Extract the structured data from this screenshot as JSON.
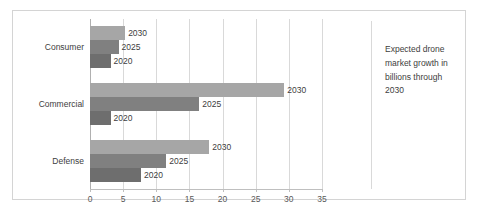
{
  "chart_data": {
    "type": "bar",
    "orientation": "horizontal",
    "title": "",
    "xlabel": "",
    "ylabel": "",
    "xlim": [
      0,
      35
    ],
    "xticks": [
      0,
      5,
      10,
      15,
      20,
      25,
      30,
      35
    ],
    "grid": true,
    "legend_position": "none",
    "categories": [
      "Consumer",
      "Commercial",
      "Defense"
    ],
    "series": [
      {
        "name": "2020",
        "values": [
          3.1,
          3.1,
          7.7
        ],
        "color": "#6e6e6e"
      },
      {
        "name": "2025",
        "values": [
          4.3,
          16.5,
          11.5
        ],
        "color": "#808080"
      },
      {
        "name": "2030",
        "values": [
          5.3,
          29.3,
          18.0
        ],
        "color": "#a6a6a6"
      }
    ],
    "data_labels": {
      "Consumer": {
        "2020": "2020",
        "2025": "2025",
        "2030": "2030"
      },
      "Commercial": {
        "2020": "2020",
        "2025": "2025",
        "2030": "2030"
      },
      "Defense": {
        "2020": "2020",
        "2025": "2025",
        "2030": "2030"
      }
    },
    "annotation": "Expected drone market growth in billions through 2030"
  },
  "colors": {
    "border": "#d4d4d4",
    "gridline": "#d9d9d9",
    "axis": "#bfbfbf",
    "text": "#404040",
    "tick_text": "#595959"
  }
}
